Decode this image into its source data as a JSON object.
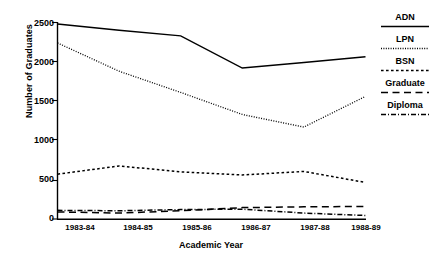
{
  "chart_data": {
    "type": "line",
    "title": "",
    "xlabel": "Academic Year",
    "ylabel": "Number of Graduates",
    "categories": [
      "1983-84",
      "1984-85",
      "1985-86",
      "1986-87",
      "1987-88",
      "1988-89"
    ],
    "ylim": [
      0,
      2500
    ],
    "yticks": [
      0,
      500,
      1000,
      1500,
      2000,
      2500
    ],
    "ytick_labels": [
      "0",
      "500",
      "1000",
      "1500",
      "2000",
      "2500"
    ],
    "grid": false,
    "legend_position": "right",
    "series": [
      {
        "name": "ADN",
        "style": "solid",
        "color": "#000000",
        "values": [
          2480,
          2400,
          2330,
          1920,
          1990,
          2065
        ]
      },
      {
        "name": "LPN",
        "style": "dotted",
        "color": "#000000",
        "values": [
          2240,
          1880,
          1610,
          1330,
          1170,
          1560
        ]
      },
      {
        "name": "BSN",
        "style": "dashed",
        "color": "#000000",
        "values": [
          570,
          675,
          600,
          560,
          605,
          465
        ]
      },
      {
        "name": "Graduate",
        "style": "long-dash",
        "color": "#000000",
        "values": [
          90,
          75,
          105,
          145,
          155,
          160
        ]
      },
      {
        "name": "Diploma",
        "style": "dash-dot",
        "color": "#000000",
        "values": [
          110,
          105,
          120,
          125,
          75,
          45
        ]
      }
    ]
  },
  "axis": {
    "ylabel": "Number of Graduates",
    "xlabel": "Academic Year",
    "yticks": [
      "2500",
      "2000",
      "1500",
      "1000",
      "500",
      "0"
    ],
    "xticks": [
      "1983-84",
      "1984-85",
      "1985-86",
      "1986-87",
      "1987-88",
      "1988-89"
    ]
  },
  "legend": {
    "items": [
      {
        "label": "ADN"
      },
      {
        "label": "LPN"
      },
      {
        "label": "BSN"
      },
      {
        "label": "Graduate"
      },
      {
        "label": "Diploma"
      }
    ]
  }
}
